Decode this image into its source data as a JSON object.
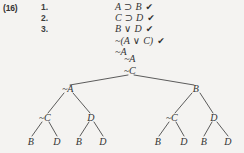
{
  "exercise": {
    "label": "(16)",
    "line_numbers": [
      "1.",
      "2.",
      "3."
    ]
  },
  "premises": [
    {
      "left": "A",
      "op": "⊃",
      "right": "B",
      "check": "✔"
    },
    {
      "left": "C",
      "op": "⊃",
      "right": "D",
      "check": "✔"
    },
    {
      "left": "B",
      "op": "∨",
      "right": "D",
      "check": "✔"
    },
    {
      "left": "~(A",
      "op": "∨",
      "right": "C)",
      "check": "✔"
    },
    {
      "left": "~A",
      "op": "",
      "right": "",
      "check": ""
    }
  ],
  "tree": {
    "trunk": [
      {
        "id": "t-na",
        "label": "~A",
        "x": 130,
        "y": 58
      },
      {
        "id": "t-nc",
        "label": "~C",
        "x": 130,
        "y": 70
      }
    ],
    "nodes": [
      {
        "id": "n-L",
        "label": "~A",
        "x": 68,
        "y": 88
      },
      {
        "id": "n-R",
        "label": "B",
        "x": 196,
        "y": 88
      },
      {
        "id": "n-LL",
        "label": "~C",
        "x": 45,
        "y": 117
      },
      {
        "id": "n-LR",
        "label": "D",
        "x": 91,
        "y": 117
      },
      {
        "id": "n-RL",
        "label": "~C",
        "x": 172,
        "y": 117
      },
      {
        "id": "n-RR",
        "label": "D",
        "x": 214,
        "y": 117
      },
      {
        "id": "n-LLa",
        "label": "B",
        "x": 31,
        "y": 141
      },
      {
        "id": "n-LLb",
        "label": "D",
        "x": 57,
        "y": 141
      },
      {
        "id": "n-LRa",
        "label": "B",
        "x": 79,
        "y": 141
      },
      {
        "id": "n-LRb",
        "label": "D",
        "x": 103,
        "y": 141
      },
      {
        "id": "n-RLa",
        "label": "B",
        "x": 158,
        "y": 141
      },
      {
        "id": "n-RLb",
        "label": "D",
        "x": 184,
        "y": 141
      },
      {
        "id": "n-RRa",
        "label": "B",
        "x": 204,
        "y": 141
      },
      {
        "id": "n-RRb",
        "label": "D",
        "x": 228,
        "y": 141
      }
    ],
    "edges": [
      {
        "x1": 128,
        "y1": 75,
        "x2": 70,
        "y2": 85
      },
      {
        "x1": 134,
        "y1": 75,
        "x2": 194,
        "y2": 85
      },
      {
        "x1": 64,
        "y1": 93,
        "x2": 48,
        "y2": 113
      },
      {
        "x1": 73,
        "y1": 93,
        "x2": 90,
        "y2": 113
      },
      {
        "x1": 192,
        "y1": 93,
        "x2": 175,
        "y2": 113
      },
      {
        "x1": 200,
        "y1": 93,
        "x2": 213,
        "y2": 113
      },
      {
        "x1": 42,
        "y1": 122,
        "x2": 32,
        "y2": 136
      },
      {
        "x1": 49,
        "y1": 122,
        "x2": 57,
        "y2": 136
      },
      {
        "x1": 89,
        "y1": 122,
        "x2": 80,
        "y2": 136
      },
      {
        "x1": 94,
        "y1": 122,
        "x2": 103,
        "y2": 136
      },
      {
        "x1": 169,
        "y1": 122,
        "x2": 159,
        "y2": 136
      },
      {
        "x1": 176,
        "y1": 122,
        "x2": 184,
        "y2": 136
      },
      {
        "x1": 212,
        "y1": 122,
        "x2": 204,
        "y2": 136
      },
      {
        "x1": 217,
        "y1": 122,
        "x2": 228,
        "y2": 136
      }
    ]
  },
  "colors": {
    "background": "#f4f3f1",
    "ink": "#333333",
    "line": "#4a4a4a"
  }
}
